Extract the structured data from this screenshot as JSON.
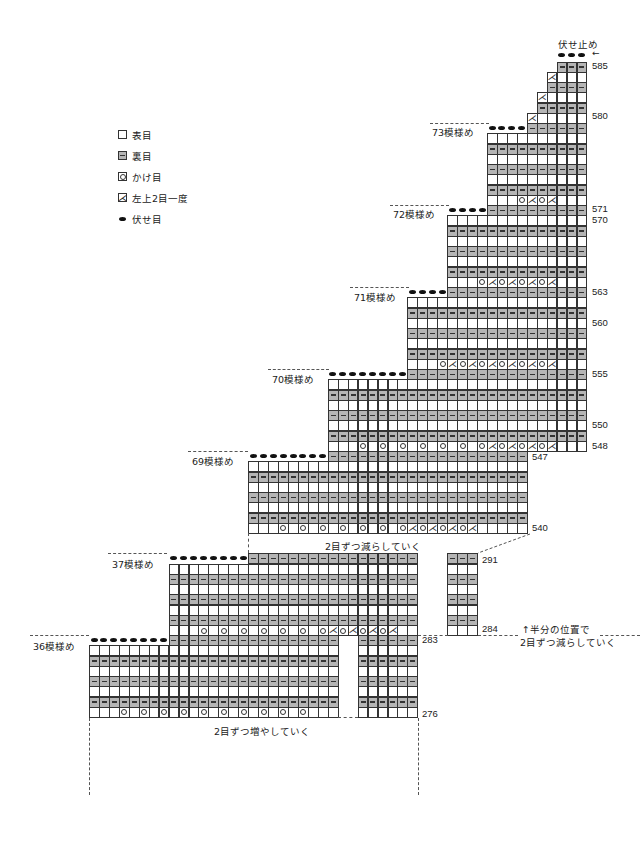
{
  "title": "伏せ止め",
  "arrow": "←",
  "legend": [
    {
      "symbol": "knit-box",
      "label": "表目"
    },
    {
      "symbol": "purl-box",
      "label": "裏目"
    },
    {
      "symbol": "yarn-over",
      "label": "かけ目"
    },
    {
      "symbol": "k2tog-left",
      "label": "左上2目一度"
    },
    {
      "symbol": "bind-off-dot",
      "label": "伏せ目"
    }
  ],
  "notes": {
    "decrease": "2目ずつ減らしていく",
    "increase": "2目ずつ増やしていく",
    "half_position_line1": "↑半分の位置で",
    "half_position_line2": "2目ずつ減らしていく"
  },
  "section_labels": [
    {
      "label": "73模様め",
      "x": 432,
      "y": 125
    },
    {
      "label": "72模様め",
      "x": 393,
      "y": 207
    },
    {
      "label": "71模様め",
      "x": 354,
      "y": 290
    },
    {
      "label": "70模様め",
      "x": 272,
      "y": 372
    },
    {
      "label": "69模様め",
      "x": 192,
      "y": 454
    },
    {
      "label": "37模様め",
      "x": 112,
      "y": 557
    },
    {
      "label": "36模様め",
      "x": 33,
      "y": 639
    }
  ],
  "row_numbers": [
    {
      "label": "585",
      "x": 592,
      "y": 60
    },
    {
      "label": "580",
      "x": 592,
      "y": 110
    },
    {
      "label": "571",
      "x": 592,
      "y": 203
    },
    {
      "label": "570",
      "x": 592,
      "y": 214
    },
    {
      "label": "563",
      "x": 592,
      "y": 286
    },
    {
      "label": "560",
      "x": 592,
      "y": 317
    },
    {
      "label": "555",
      "x": 592,
      "y": 368
    },
    {
      "label": "550",
      "x": 592,
      "y": 419
    },
    {
      "label": "548",
      "x": 592,
      "y": 440
    },
    {
      "label": "547",
      "x": 532,
      "y": 451
    },
    {
      "label": "540",
      "x": 532,
      "y": 522
    },
    {
      "label": "291",
      "x": 482,
      "y": 554
    },
    {
      "label": "284",
      "x": 482,
      "y": 623
    },
    {
      "label": "283",
      "x": 422,
      "y": 634
    },
    {
      "label": "276",
      "x": 422,
      "y": 708
    }
  ],
  "chart_data": {
    "type": "knitting-chart",
    "title": "伏せ止め",
    "grid": {
      "x0": 89,
      "col_w": 9.95,
      "row_h": 10.25
    },
    "symbols": {
      "K": "表目 (knit)",
      "P": "裏目 (purl)",
      "O": "かけ目 (yarn over)",
      "L": "左上2目一度 (k2tog left)",
      "B": "伏せ目 (bind off)"
    },
    "rows": [
      {
        "row": 585,
        "top": 61.5,
        "segments": [
          [
            47,
            49,
            "P"
          ]
        ],
        "bindoff_above": [
          47,
          48,
          49
        ]
      },
      {
        "row": 584,
        "top": 71.75,
        "segments": [
          [
            46,
            49,
            "K"
          ]
        ],
        "k2tog": [
          46
        ]
      },
      {
        "row": 583,
        "top": 82,
        "segments": [
          [
            46,
            49,
            "P"
          ]
        ]
      },
      {
        "row": 582,
        "top": 92.25,
        "segments": [
          [
            45,
            49,
            "K"
          ]
        ],
        "k2tog": [
          45
        ]
      },
      {
        "row": 581,
        "top": 102.5,
        "segments": [
          [
            45,
            49,
            "P"
          ]
        ]
      },
      {
        "row": 580,
        "top": 112.75,
        "segments": [
          [
            44,
            49,
            "K"
          ]
        ],
        "k2tog": [
          44
        ]
      },
      {
        "row": 579,
        "top": 123,
        "segments": [
          [
            44,
            49,
            "P"
          ]
        ],
        "bindoff": [
          40,
          41,
          42,
          43
        ]
      },
      {
        "row": 578,
        "top": 133.25,
        "segments": [
          [
            40,
            49,
            "K"
          ]
        ]
      },
      {
        "row": 577,
        "top": 143.5,
        "segments": [
          [
            40,
            49,
            "P"
          ]
        ]
      },
      {
        "row": 576,
        "top": 153.75,
        "segments": [
          [
            40,
            49,
            "K"
          ]
        ]
      },
      {
        "row": 575,
        "top": 164,
        "segments": [
          [
            40,
            49,
            "P"
          ]
        ]
      },
      {
        "row": 574,
        "top": 174.25,
        "segments": [
          [
            40,
            49,
            "K"
          ]
        ]
      },
      {
        "row": 573,
        "top": 184.5,
        "segments": [
          [
            40,
            49,
            "P"
          ]
        ]
      },
      {
        "row": 572,
        "top": 194.75,
        "segments": [
          [
            40,
            49,
            "K"
          ]
        ],
        "yo": [
          43,
          45
        ],
        "k2tog": [
          44,
          46
        ]
      },
      {
        "row": 571,
        "top": 205,
        "segments": [
          [
            40,
            49,
            "P"
          ]
        ],
        "bindoff": [
          36,
          37,
          38,
          39
        ]
      },
      {
        "row": 570,
        "top": 215.25,
        "segments": [
          [
            36,
            49,
            "K"
          ]
        ]
      },
      {
        "row": 569,
        "top": 225.5,
        "segments": [
          [
            36,
            49,
            "P"
          ]
        ]
      },
      {
        "row": 568,
        "top": 235.75,
        "segments": [
          [
            36,
            49,
            "K"
          ]
        ]
      },
      {
        "row": 567,
        "top": 246,
        "segments": [
          [
            36,
            49,
            "P"
          ]
        ]
      },
      {
        "row": 566,
        "top": 256.25,
        "segments": [
          [
            36,
            49,
            "K"
          ]
        ]
      },
      {
        "row": 565,
        "top": 266.5,
        "segments": [
          [
            36,
            49,
            "P"
          ]
        ]
      },
      {
        "row": 564,
        "top": 276.75,
        "segments": [
          [
            36,
            49,
            "K"
          ]
        ],
        "yo": [
          39,
          41,
          43,
          45
        ],
        "k2tog": [
          40,
          42,
          44,
          46
        ]
      },
      {
        "row": 563,
        "top": 287,
        "segments": [
          [
            36,
            49,
            "P"
          ]
        ],
        "bindoff": [
          32,
          33,
          34,
          35
        ]
      },
      {
        "row": 562,
        "top": 297.25,
        "segments": [
          [
            32,
            49,
            "K"
          ]
        ]
      },
      {
        "row": 561,
        "top": 307.5,
        "segments": [
          [
            32,
            49,
            "P"
          ]
        ]
      },
      {
        "row": 560,
        "top": 317.75,
        "segments": [
          [
            32,
            49,
            "K"
          ]
        ]
      },
      {
        "row": 559,
        "top": 328,
        "segments": [
          [
            32,
            49,
            "P"
          ]
        ]
      },
      {
        "row": 558,
        "top": 338.25,
        "segments": [
          [
            32,
            49,
            "K"
          ]
        ]
      },
      {
        "row": 557,
        "top": 348.5,
        "segments": [
          [
            32,
            49,
            "P"
          ]
        ]
      },
      {
        "row": 556,
        "top": 358.75,
        "segments": [
          [
            32,
            49,
            "K"
          ]
        ],
        "yo": [
          35,
          37,
          39,
          41,
          43,
          45
        ],
        "k2tog": [
          36,
          38,
          40,
          42,
          44,
          46
        ]
      },
      {
        "row": 555,
        "top": 369,
        "segments": [
          [
            32,
            49,
            "P"
          ]
        ],
        "bindoff": [
          24,
          25,
          26,
          27,
          28,
          29,
          30,
          31
        ]
      },
      {
        "row": 554,
        "top": 379.25,
        "segments": [
          [
            24,
            49,
            "K"
          ]
        ]
      },
      {
        "row": 553,
        "top": 389.5,
        "segments": [
          [
            24,
            49,
            "P"
          ]
        ]
      },
      {
        "row": 552,
        "top": 399.75,
        "segments": [
          [
            24,
            49,
            "K"
          ]
        ]
      },
      {
        "row": 551,
        "top": 410,
        "segments": [
          [
            24,
            49,
            "P"
          ]
        ]
      },
      {
        "row": 550,
        "top": 420.25,
        "segments": [
          [
            24,
            49,
            "K"
          ]
        ]
      },
      {
        "row": 549,
        "top": 430.5,
        "segments": [
          [
            24,
            49,
            "P"
          ]
        ]
      },
      {
        "row": 548,
        "top": 440.75,
        "segments": [
          [
            24,
            49,
            "K"
          ]
        ],
        "yo": [
          27,
          29,
          31,
          33,
          35,
          37,
          39,
          41,
          43,
          45
        ],
        "k2tog": [
          40,
          42,
          44,
          46
        ]
      },
      {
        "row": 547,
        "top": 451,
        "segments": [
          [
            24,
            43,
            "P"
          ]
        ],
        "bindoff": [
          16,
          17,
          18,
          19,
          20,
          21,
          22,
          23
        ]
      },
      {
        "row": 546,
        "top": 461.25,
        "segments": [
          [
            16,
            43,
            "K"
          ]
        ]
      },
      {
        "row": 545,
        "top": 471.5,
        "segments": [
          [
            16,
            43,
            "P"
          ]
        ]
      },
      {
        "row": 544,
        "top": 481.75,
        "segments": [
          [
            16,
            43,
            "K"
          ]
        ]
      },
      {
        "row": 543,
        "top": 492,
        "segments": [
          [
            16,
            43,
            "P"
          ]
        ]
      },
      {
        "row": 542,
        "top": 502.25,
        "segments": [
          [
            16,
            43,
            "K"
          ]
        ]
      },
      {
        "row": 541,
        "top": 512.5,
        "segments": [
          [
            16,
            43,
            "P"
          ]
        ]
      },
      {
        "row": 540,
        "top": 522.75,
        "segments": [
          [
            16,
            43,
            "K"
          ]
        ],
        "yo": [
          19,
          21,
          23,
          25,
          27,
          29,
          31,
          33,
          35,
          37
        ],
        "k2tog": [
          32,
          34,
          36,
          38
        ]
      },
      {
        "row": 291,
        "top": 553.25,
        "segments": [
          [
            16,
            32,
            "P"
          ],
          [
            36,
            38,
            "P"
          ]
        ],
        "bindoff": [
          8,
          9,
          10,
          11,
          12,
          13,
          14,
          15
        ]
      },
      {
        "row": 290,
        "top": 563.5,
        "segments": [
          [
            8,
            32,
            "K"
          ],
          [
            36,
            38,
            "K"
          ]
        ]
      },
      {
        "row": 289,
        "top": 573.75,
        "segments": [
          [
            8,
            32,
            "P"
          ],
          [
            36,
            38,
            "P"
          ]
        ]
      },
      {
        "row": 288,
        "top": 584,
        "segments": [
          [
            8,
            32,
            "K"
          ],
          [
            36,
            38,
            "K"
          ]
        ]
      },
      {
        "row": 287,
        "top": 594.25,
        "segments": [
          [
            8,
            32,
            "P"
          ],
          [
            36,
            38,
            "P"
          ]
        ]
      },
      {
        "row": 286,
        "top": 604.5,
        "segments": [
          [
            8,
            32,
            "K"
          ],
          [
            36,
            38,
            "K"
          ]
        ]
      },
      {
        "row": 285,
        "top": 614.75,
        "segments": [
          [
            8,
            32,
            "P"
          ],
          [
            36,
            38,
            "P"
          ]
        ]
      },
      {
        "row": 284,
        "top": 625,
        "segments": [
          [
            8,
            32,
            "K"
          ],
          [
            36,
            38,
            "K"
          ]
        ],
        "yo": [
          11,
          13,
          15,
          17,
          19,
          21,
          23,
          25,
          27,
          29
        ],
        "k2tog": [
          24,
          26,
          28,
          30
        ]
      },
      {
        "row": 283,
        "top": 635,
        "segments": [
          [
            8,
            24,
            "P"
          ],
          [
            27,
            32,
            "P"
          ]
        ],
        "bindoff": [
          0,
          1,
          2,
          3,
          4,
          5,
          6,
          7
        ]
      },
      {
        "row": 282,
        "top": 645.25,
        "segments": [
          [
            0,
            24,
            "K"
          ],
          [
            27,
            32,
            "K"
          ]
        ]
      },
      {
        "row": 281,
        "top": 655.5,
        "segments": [
          [
            0,
            24,
            "P"
          ],
          [
            27,
            32,
            "P"
          ]
        ]
      },
      {
        "row": 280,
        "top": 665.75,
        "segments": [
          [
            0,
            24,
            "K"
          ],
          [
            27,
            32,
            "K"
          ]
        ]
      },
      {
        "row": 279,
        "top": 676,
        "segments": [
          [
            0,
            24,
            "P"
          ],
          [
            27,
            32,
            "P"
          ]
        ]
      },
      {
        "row": 278,
        "top": 686.25,
        "segments": [
          [
            0,
            24,
            "K"
          ],
          [
            27,
            32,
            "K"
          ]
        ]
      },
      {
        "row": 277,
        "top": 696.5,
        "segments": [
          [
            0,
            24,
            "P"
          ],
          [
            27,
            32,
            "P"
          ]
        ]
      },
      {
        "row": 276,
        "top": 706.75,
        "segments": [
          [
            0,
            24,
            "K"
          ],
          [
            27,
            32,
            "K"
          ]
        ],
        "yo": [
          3,
          5,
          7,
          9,
          11,
          13,
          15,
          17,
          19,
          21
        ]
      }
    ]
  },
  "dashes_h": [
    {
      "x": 430,
      "y": 123,
      "w": 59
    },
    {
      "x": 390,
      "y": 205,
      "w": 59
    },
    {
      "x": 350,
      "y": 287,
      "w": 59
    },
    {
      "x": 268,
      "y": 369,
      "w": 61
    },
    {
      "x": 188,
      "y": 451,
      "w": 60
    },
    {
      "x": 108,
      "y": 553,
      "w": 59
    },
    {
      "x": 30,
      "y": 635,
      "w": 59
    },
    {
      "x": 418,
      "y": 635,
      "w": 30
    },
    {
      "x": 478,
      "y": 635,
      "w": 40
    },
    {
      "x": 600,
      "y": 635,
      "w": 40
    },
    {
      "x": 338,
      "y": 717,
      "w": 20
    }
  ],
  "dashes_v": [
    {
      "x": 89,
      "y": 718,
      "h": 77
    },
    {
      "x": 418,
      "y": 718,
      "h": 77
    },
    {
      "x": 248,
      "y": 533,
      "h": 20
    }
  ]
}
